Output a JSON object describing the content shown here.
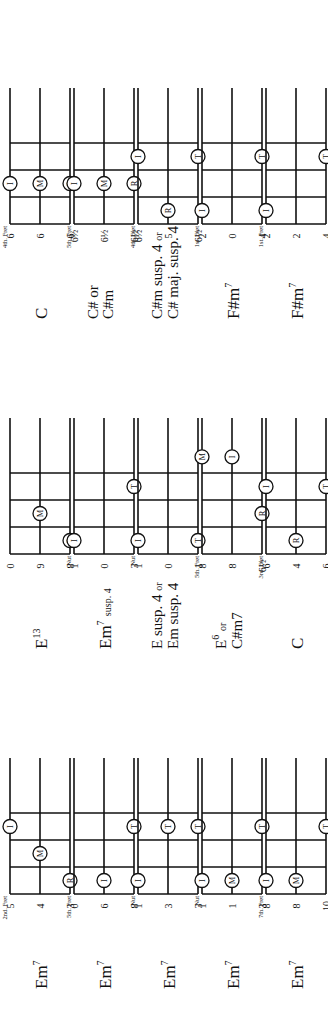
{
  "rows": [
    {
      "chords": [
        {
          "name": "Em",
          "sup": "7",
          "extra": "",
          "name2": "",
          "position": "2nd. Fret",
          "tuning": [
            "5",
            "4",
            "3"
          ],
          "dots": [
            {
              "s": 0,
              "f": 3,
              "l": "I"
            },
            {
              "s": 1,
              "f": 2,
              "l": "M"
            },
            {
              "s": 2,
              "f": 1,
              "l": "R"
            }
          ]
        },
        {
          "name": "E",
          "sup": "13",
          "extra": "",
          "name2": "",
          "position": "",
          "tuning": [
            "0",
            "9",
            "8"
          ],
          "dots": [
            {
              "s": 1,
              "f": 2,
              "l": "M"
            },
            {
              "s": 2,
              "f": 1,
              "l": "R"
            }
          ]
        },
        {
          "name": "C",
          "sup": "",
          "extra": "",
          "name2": "",
          "position": "4th. Fret",
          "tuning": [
            "6",
            "6",
            "6"
          ],
          "dots": [
            {
              "s": 0,
              "f": 2,
              "l": "I"
            },
            {
              "s": 1,
              "f": 2,
              "l": "M"
            },
            {
              "s": 2,
              "f": 2,
              "l": "R"
            }
          ]
        }
      ]
    },
    {
      "chords": [
        {
          "name": "Em",
          "sup": "7",
          "extra": "",
          "name2": "",
          "position": "5th. Fret",
          "tuning": [
            "0",
            "6",
            "8"
          ],
          "dots": [
            {
              "s": 1,
              "f": 1,
              "l": "I"
            },
            {
              "s": 2,
              "f": 3,
              "l": "T"
            }
          ]
        },
        {
          "name": "Em",
          "sup": "7",
          "extra": "susp. 4",
          "name2": "",
          "position": "Nut",
          "tuning": [
            "1",
            "0",
            "3"
          ],
          "dots": [
            {
              "s": 0,
              "f": 1,
              "l": "I"
            },
            {
              "s": 2,
              "f": 3,
              "l": "T"
            }
          ]
        },
        {
          "name": "C# or",
          "sup": "",
          "extra": "",
          "name2": "C#m",
          "position": "5th. Fret",
          "tuning": [
            "6½",
            "6½",
            "6½"
          ],
          "dots": [
            {
              "s": 0,
              "f": 2,
              "l": "I"
            },
            {
              "s": 1,
              "f": 2,
              "l": "M"
            },
            {
              "s": 2,
              "f": 2,
              "l": "R"
            }
          ]
        }
      ]
    },
    {
      "chords": [
        {
          "name": "Em",
          "sup": "7",
          "extra": "",
          "name2": "",
          "position": "Nut",
          "tuning": [
            "1",
            "3",
            "3"
          ],
          "dots": [
            {
              "s": 0,
              "f": 1,
              "l": "I"
            },
            {
              "s": 1,
              "f": 3,
              "l": "T"
            },
            {
              "s": 2,
              "f": 3,
              "l": "T"
            }
          ]
        },
        {
          "name": "E susp. 4",
          "sup": "",
          "extra": "or",
          "name2": "Em susp. 4",
          "position": "Nut",
          "tuning": [
            "1",
            "0",
            "1"
          ],
          "dots": [
            {
              "s": 0,
              "f": 1,
              "l": "I"
            },
            {
              "s": 2,
              "f": 1,
              "l": "T"
            }
          ]
        },
        {
          "name": "C#m susp. 4",
          "sup": "",
          "extra": "or",
          "name2": "C# maj. susp. 4",
          "position": "4th. Fret",
          "tuning": [
            "6½",
            "5",
            "6½"
          ],
          "dots": [
            {
              "s": 0,
              "f": 3,
              "l": "I"
            },
            {
              "s": 1,
              "f": 1,
              "l": "R"
            },
            {
              "s": 2,
              "f": 3,
              "l": "T"
            }
          ]
        }
      ]
    },
    {
      "chords": [
        {
          "name": "Em",
          "sup": "7",
          "extra": "",
          "name2": "",
          "position": "Nut",
          "tuning": [
            "1",
            "1",
            "3"
          ],
          "dots": [
            {
              "s": 0,
              "f": 1,
              "l": "I"
            },
            {
              "s": 1,
              "f": 1,
              "l": "M"
            },
            {
              "s": 2,
              "f": 3,
              "l": "T"
            }
          ]
        },
        {
          "name": "E",
          "sup": "6",
          "extra": "or",
          "name2": "C#m7",
          "position": "5th. Fret",
          "tuning": [
            "8",
            "8",
            "6½"
          ],
          "dots": [
            {
              "s": 0,
              "f": 4,
              "l": "M"
            },
            {
              "s": 1,
              "f": 4,
              "l": "I"
            },
            {
              "s": 2,
              "f": 2,
              "l": "R"
            }
          ]
        },
        {
          "name": "F#m",
          "sup": "7",
          "extra": "",
          "name2": "",
          "position": "1st. Fret",
          "tuning": [
            "2",
            "0",
            "4"
          ],
          "dots": [
            {
              "s": 0,
              "f": 1,
              "l": "I"
            },
            {
              "s": 2,
              "f": 3,
              "l": "T"
            }
          ]
        }
      ]
    },
    {
      "chords": [
        {
          "name": "Em",
          "sup": "7",
          "extra": "",
          "name2": "",
          "position": "7th. Fret",
          "tuning": [
            "8",
            "8",
            "10"
          ],
          "dots": [
            {
              "s": 0,
              "f": 1,
              "l": "I"
            },
            {
              "s": 1,
              "f": 1,
              "l": "M"
            },
            {
              "s": 2,
              "f": 3,
              "l": "T"
            }
          ]
        },
        {
          "name": "C",
          "sup": "",
          "extra": "",
          "name2": "",
          "position": "3rd. Fret",
          "tuning": [
            "6",
            "4",
            "6"
          ],
          "dots": [
            {
              "s": 0,
              "f": 3,
              "l": "I"
            },
            {
              "s": 1,
              "f": 1,
              "l": "R"
            },
            {
              "s": 2,
              "f": 3,
              "l": "T"
            }
          ]
        },
        {
          "name": "F#m",
          "sup": "7",
          "extra": "",
          "name2": "",
          "position": "1st. Fret",
          "tuning": [
            "2",
            "2",
            "4"
          ],
          "dots": [
            {
              "s": 0,
              "f": 1,
              "l": "I"
            },
            {
              "s": 2,
              "f": 3,
              "l": "T"
            }
          ]
        }
      ]
    }
  ],
  "colors": {
    "ink": "#111111",
    "paper": "#ffffff"
  }
}
